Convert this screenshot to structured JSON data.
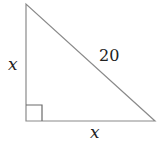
{
  "diagram": {
    "type": "right-triangle",
    "line_color": "#8a8a8a",
    "vertices": {
      "top": [
        26,
        4
      ],
      "right_angle": [
        26,
        121
      ],
      "bottom_right": [
        155,
        121
      ]
    },
    "labels": {
      "left_leg": "x",
      "hypotenuse": "20",
      "bottom_leg": "x"
    },
    "right_angle_marker": true
  }
}
